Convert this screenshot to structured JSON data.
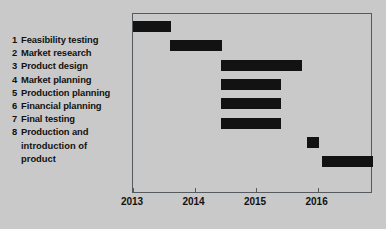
{
  "chart_data": {
    "type": "bar",
    "subtype": "gantt",
    "title": "",
    "xlabel": "",
    "ylabel": "",
    "xlim": [
      2013,
      2016.9
    ],
    "grid": false,
    "legend": false,
    "axis_ticks": [
      "2013",
      "2014",
      "2015",
      "2016"
    ],
    "axis_tick_values": [
      2013,
      2014,
      2015,
      2016
    ],
    "categories": [
      "Feasibility testing",
      "Market research",
      "Product design",
      "Market planning",
      "Production planning",
      "Financial planning",
      "Final testing",
      "Production and introduction of product"
    ],
    "tasks": [
      {
        "num": "1",
        "label": "Feasibility testing",
        "start": 2013.0,
        "end": 2013.62
      },
      {
        "num": "2",
        "label": "Market research",
        "start": 2013.6,
        "end": 2014.45
      },
      {
        "num": "3",
        "label": "Product design",
        "start": 2014.43,
        "end": 2015.75
      },
      {
        "num": "4",
        "label": "Market planning",
        "start": 2014.43,
        "end": 2015.41
      },
      {
        "num": "5",
        "label": "Production planning",
        "start": 2014.43,
        "end": 2015.41
      },
      {
        "num": "6",
        "label": "Financial planning",
        "start": 2014.43,
        "end": 2015.41
      },
      {
        "num": "7",
        "label": "Final testing",
        "start": 2015.82,
        "end": 2016.03
      },
      {
        "num": "8",
        "label": "Production and introduction of product",
        "start": 2016.07,
        "end": 2016.9
      }
    ]
  },
  "task_list": [
    {
      "num": "1",
      "label": "Feasibility testing",
      "cont": []
    },
    {
      "num": "2",
      "label": "Market research",
      "cont": []
    },
    {
      "num": "3",
      "label": "Product design",
      "cont": []
    },
    {
      "num": "4",
      "label": "Market planning",
      "cont": []
    },
    {
      "num": "5",
      "label": "Production planning",
      "cont": []
    },
    {
      "num": "6",
      "label": "Financial planning",
      "cont": []
    },
    {
      "num": "7",
      "label": "Final testing",
      "cont": []
    },
    {
      "num": "8",
      "label": "Production and",
      "cont": [
        "introduction of",
        "product"
      ]
    }
  ],
  "axis": {
    "ticks": [
      {
        "label": "2013",
        "value": 2013
      },
      {
        "label": "2014",
        "value": 2014
      },
      {
        "label": "2015",
        "value": 2015
      },
      {
        "label": "2016",
        "value": 2016
      }
    ]
  },
  "colors": {
    "background": "#c9c9c9",
    "bar": "#121212",
    "frame": "#555a5e",
    "text": "#111111"
  }
}
